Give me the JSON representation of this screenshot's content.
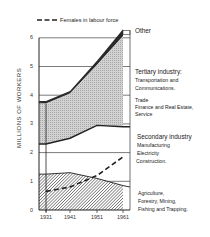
{
  "chart_data": {
    "type": "area",
    "title": "",
    "xlabel": "",
    "ylabel": "MILLIONS OF WORKERS",
    "x": [
      1931,
      1941,
      1951,
      1961
    ],
    "ylim": [
      0,
      6.5
    ],
    "yticks": [
      "0",
      "1",
      "2",
      "3",
      "4",
      "5",
      "6"
    ],
    "xticks": [
      "1931",
      "1941",
      "1951",
      "1961"
    ],
    "grid": true,
    "stacked": true,
    "series": [
      {
        "name": "Agriculture, Forestry, Mining, Fishing and Trapping",
        "values": [
          1.25,
          1.3,
          1.1,
          0.85
        ]
      },
      {
        "name": "Secondary industry: Manufacturing, Electricity, Construction",
        "values": [
          1.05,
          1.2,
          1.85,
          2.05
        ]
      },
      {
        "name": "Tertiary industry: Transportation and Communications, Trade, Finance and Real Estate, Service",
        "values": [
          1.4,
          1.55,
          2.1,
          3.15
        ]
      },
      {
        "name": "Other",
        "values": [
          0.1,
          0.1,
          0.15,
          0.25
        ]
      }
    ],
    "cumulative_boundaries": {
      "primary_top": [
        1.25,
        1.3,
        1.1,
        0.85
      ],
      "secondary_top": [
        2.3,
        2.5,
        2.95,
        2.9
      ],
      "tertiary_top": [
        3.7,
        4.05,
        5.05,
        6.05
      ],
      "other_top": [
        3.8,
        4.15,
        5.2,
        6.3
      ]
    },
    "overlay_series": [
      {
        "name": "Females in labour force",
        "style": "dashed",
        "values": [
          0.65,
          0.8,
          1.2,
          1.85
        ]
      }
    ],
    "legend": {
      "position": "top",
      "entries": [
        "Females in labour force"
      ]
    }
  },
  "labels": {
    "legend_females": "Females in labour force",
    "y_axis_title": "MILLIONS OF WORKERS",
    "other": "Other",
    "tertiary_header": "Tertiary industry:",
    "tertiary_1": "Transportation and",
    "tertiary_2": "Communications.",
    "tertiary_3": "Trade",
    "tertiary_4": "Finance and Real Estate,",
    "tertiary_5": "Service",
    "secondary_header": "Secondary industry",
    "secondary_1": "Manufacturing",
    "secondary_2": "Electricity",
    "secondary_3": "Construction.",
    "primary_1": "Agriculture,",
    "primary_2": "Forestry,  Mining,",
    "primary_3": "Fishing and Trapping."
  },
  "colors": {
    "ink": "#222222",
    "tertiary_fill": "#c9c9c9",
    "primary_hatch": "#555555",
    "other_band": "#333333"
  }
}
